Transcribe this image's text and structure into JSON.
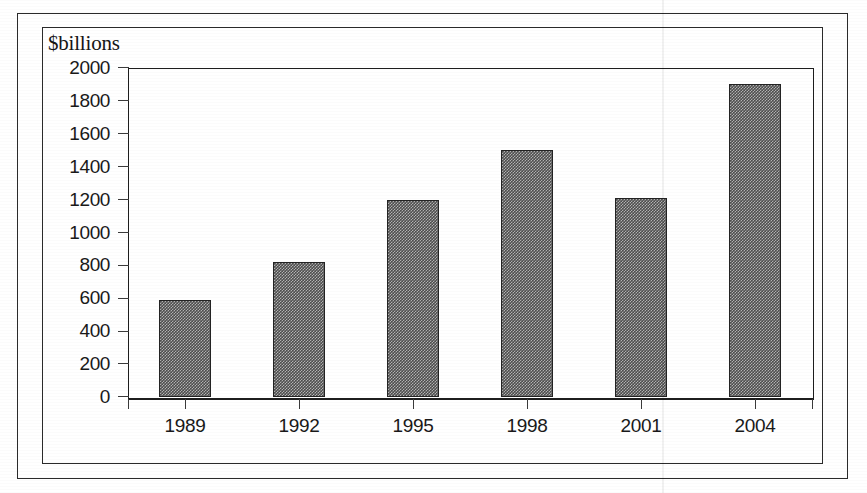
{
  "figure": {
    "background_color": "#ffffff",
    "frame_color": "#2b2b2b",
    "axis_color": "#1d1d1d",
    "bar_color": "#4e4e4e",
    "bar_edge_color": "#232323",
    "text_color": "#191919"
  },
  "chart_data": {
    "type": "bar",
    "title": "",
    "subtitle": "",
    "ylabel": "$billions",
    "xlabel": "",
    "categories": [
      "1989",
      "1992",
      "1995",
      "1998",
      "2001",
      "2004"
    ],
    "values": [
      590,
      820,
      1200,
      1500,
      1210,
      1900
    ],
    "series": [
      {
        "name": "$billions",
        "values": [
          590,
          820,
          1200,
          1500,
          1210,
          1900
        ]
      }
    ],
    "ylim": [
      0,
      2000
    ],
    "ytick_labels": [
      "0",
      "200",
      "400",
      "600",
      "800",
      "1000",
      "1200",
      "1400",
      "1600",
      "1800",
      "2000"
    ],
    "ytick_values": [
      0,
      200,
      400,
      600,
      800,
      1000,
      1200,
      1400,
      1600,
      1800,
      2000
    ],
    "xtick_labels": [
      "1989",
      "1992",
      "1995",
      "1998",
      "2001",
      "2004"
    ],
    "grid": false,
    "legend": false,
    "legend_position": "none",
    "annotations": []
  }
}
